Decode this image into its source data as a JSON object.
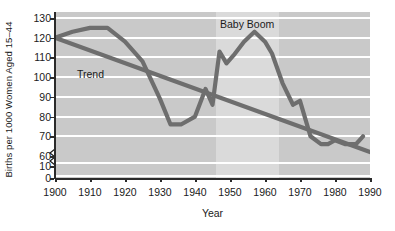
{
  "chart_data": {
    "type": "line",
    "title": "",
    "xlabel": "Year",
    "ylabel": "Births per 1000 Women Aged 15–44",
    "xlim": [
      1900,
      1990
    ],
    "ylim": [
      0,
      130
    ],
    "y_axis_break": true,
    "y_break_between": [
      10,
      60
    ],
    "grid": true,
    "gridlines_y": [
      70,
      80,
      90,
      100,
      110,
      120,
      130
    ],
    "xticks": [
      1900,
      1910,
      1920,
      1930,
      1940,
      1950,
      1960,
      1970,
      1980,
      1990
    ],
    "yticks": [
      0,
      10,
      60,
      70,
      80,
      90,
      100,
      110,
      120,
      130
    ],
    "legend": "none",
    "annotations": [
      {
        "text": "Trend",
        "x": 1908,
        "y": 101
      },
      {
        "text": "Baby Boom",
        "x": 1951,
        "y": 130
      }
    ],
    "shaded_bands": [
      {
        "label": "Baby Boom",
        "x_start": 1946,
        "x_end": 1964,
        "color": "#dadada"
      }
    ],
    "plot_background": "#c9c9c9",
    "line_color": "#6e6e6e",
    "series": [
      {
        "name": "Birth rate",
        "x": [
          1900,
          1905,
          1910,
          1915,
          1920,
          1925,
          1930,
          1933,
          1936,
          1940,
          1943,
          1945,
          1947,
          1949,
          1951,
          1954,
          1957,
          1960,
          1962,
          1965,
          1968,
          1970,
          1973,
          1976,
          1978,
          1980,
          1983,
          1986,
          1988
        ],
        "values": [
          120,
          123,
          125,
          125,
          118,
          108,
          89,
          76,
          76,
          80,
          94,
          86,
          113,
          107,
          111,
          118,
          123,
          118,
          112,
          97,
          86,
          88,
          70,
          66,
          66,
          68,
          66,
          66,
          70
        ]
      },
      {
        "name": "Trend",
        "x": [
          1900,
          1990
        ],
        "values": [
          120,
          62
        ]
      }
    ]
  }
}
